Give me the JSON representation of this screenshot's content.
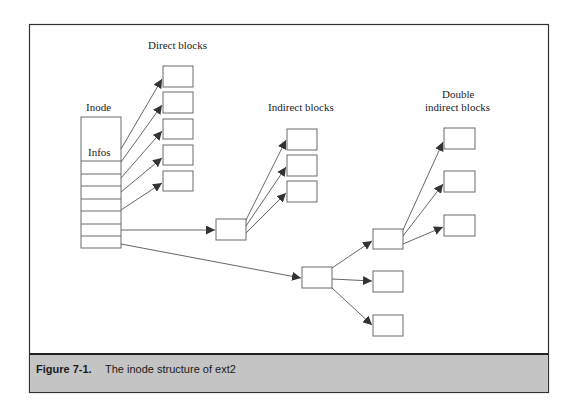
{
  "diagram": {
    "labels": {
      "direct_blocks": "Direct blocks",
      "inode": "Inode",
      "infos": "Infos",
      "indirect_blocks": "Indirect blocks",
      "double_indirect_line1": "Double",
      "double_indirect_line2": "indirect blocks"
    },
    "nodes": {
      "inode": {
        "x": 81,
        "y": 117,
        "w": 40,
        "h": 131,
        "slot_dividers_y": [
          161,
          174,
          186,
          199,
          211,
          224,
          236
        ]
      },
      "direct_blocks": [
        {
          "x": 163,
          "y": 66,
          "w": 30,
          "h": 21
        },
        {
          "x": 163,
          "y": 92,
          "w": 30,
          "h": 21
        },
        {
          "x": 163,
          "y": 119,
          "w": 30,
          "h": 20
        },
        {
          "x": 163,
          "y": 145,
          "w": 30,
          "h": 20
        },
        {
          "x": 163,
          "y": 171,
          "w": 30,
          "h": 20
        }
      ],
      "indirect_pointer_block": {
        "x": 216,
        "y": 219,
        "w": 30,
        "h": 21
      },
      "indirect_data_blocks": [
        {
          "x": 287,
          "y": 129,
          "w": 30,
          "h": 21
        },
        {
          "x": 287,
          "y": 155,
          "w": 30,
          "h": 21
        },
        {
          "x": 287,
          "y": 181,
          "w": 30,
          "h": 21
        }
      ],
      "double_indirect_l1_block": {
        "x": 302,
        "y": 267,
        "w": 30,
        "h": 21
      },
      "double_indirect_l2_block": {
        "x": 373,
        "y": 229,
        "w": 30,
        "h": 20
      },
      "double_indirect_l2_siblings": [
        {
          "x": 373,
          "y": 271,
          "w": 30,
          "h": 21
        },
        {
          "x": 373,
          "y": 315,
          "w": 30,
          "h": 21
        }
      ],
      "double_indirect_data_blocks": [
        {
          "x": 444,
          "y": 128,
          "w": 31,
          "h": 21
        },
        {
          "x": 444,
          "y": 171,
          "w": 31,
          "h": 21
        },
        {
          "x": 444,
          "y": 215,
          "w": 31,
          "h": 21
        }
      ]
    },
    "edges": [
      {
        "from": "inode",
        "to": "direct_block_1"
      },
      {
        "from": "inode",
        "to": "direct_block_2"
      },
      {
        "from": "inode",
        "to": "direct_block_3"
      },
      {
        "from": "inode",
        "to": "direct_block_4"
      },
      {
        "from": "inode",
        "to": "direct_block_5"
      },
      {
        "from": "inode",
        "to": "indirect_pointer_block"
      },
      {
        "from": "indirect_pointer_block",
        "to": "indirect_data_block_1"
      },
      {
        "from": "indirect_pointer_block",
        "to": "indirect_data_block_2"
      },
      {
        "from": "indirect_pointer_block",
        "to": "indirect_data_block_3"
      },
      {
        "from": "inode",
        "to": "double_indirect_l1_block"
      },
      {
        "from": "double_indirect_l1_block",
        "to": "double_indirect_l2_block"
      },
      {
        "from": "double_indirect_l1_block",
        "to": "double_indirect_l2_sibling_1"
      },
      {
        "from": "double_indirect_l1_block",
        "to": "double_indirect_l2_sibling_2"
      },
      {
        "from": "double_indirect_l2_block",
        "to": "double_indirect_data_block_1"
      },
      {
        "from": "double_indirect_l2_block",
        "to": "double_indirect_data_block_2"
      },
      {
        "from": "double_indirect_l2_block",
        "to": "double_indirect_data_block_3"
      }
    ]
  },
  "caption": {
    "number": "Figure 7-1.",
    "text": "The inode structure of ext2",
    "background": "#c4c4c4"
  },
  "colors": {
    "frame": "#333333",
    "block_stroke": "#6a6a6a",
    "arrow": "#555555"
  }
}
